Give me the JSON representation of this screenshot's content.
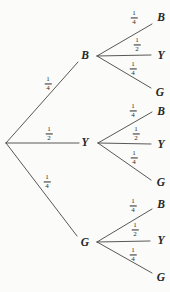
{
  "diagram": {
    "type": "probability-tree",
    "stages": 2,
    "colors": {
      "line": "#454545",
      "text": "#262626",
      "background": "#fbfbf9"
    },
    "stage1": [
      {
        "node": "B",
        "probability": {
          "numerator": "1",
          "denominator": "4",
          "value": "1/4"
        }
      },
      {
        "node": "Y",
        "probability": {
          "numerator": "1",
          "denominator": "2",
          "value": "1/2"
        }
      },
      {
        "node": "G",
        "probability": {
          "numerator": "1",
          "denominator": "4",
          "value": "1/4"
        }
      }
    ],
    "stage2": [
      {
        "parent": "B",
        "branches": [
          {
            "outcome": "B",
            "probability": {
              "numerator": "1",
              "denominator": "4",
              "value": "1/4"
            }
          },
          {
            "outcome": "Y",
            "probability": {
              "numerator": "1",
              "denominator": "2",
              "value": "1/2"
            }
          },
          {
            "outcome": "G",
            "probability": {
              "numerator": "1",
              "denominator": "4",
              "value": "1/4"
            }
          }
        ]
      },
      {
        "parent": "Y",
        "branches": [
          {
            "outcome": "B",
            "probability": {
              "numerator": "1",
              "denominator": "4",
              "value": "1/4"
            }
          },
          {
            "outcome": "Y",
            "probability": {
              "numerator": "1",
              "denominator": "2",
              "value": "1/2"
            }
          },
          {
            "outcome": "G",
            "probability": {
              "numerator": "1",
              "denominator": "4",
              "value": "1/4"
            }
          }
        ]
      },
      {
        "parent": "G",
        "branches": [
          {
            "outcome": "B",
            "probability": {
              "numerator": "1",
              "denominator": "4",
              "value": "1/4"
            }
          },
          {
            "outcome": "Y",
            "probability": {
              "numerator": "1",
              "denominator": "2",
              "value": "1/2"
            }
          },
          {
            "outcome": "G",
            "probability": {
              "numerator": "1",
              "denominator": "4",
              "value": "1/4"
            }
          }
        ]
      }
    ]
  }
}
